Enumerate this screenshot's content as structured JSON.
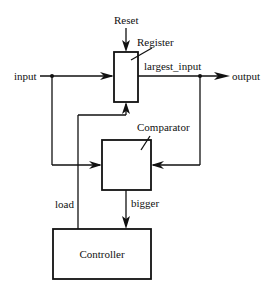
{
  "diagram": {
    "type": "block-diagram",
    "blocks": {
      "register": {
        "label": "Register"
      },
      "comparator": {
        "label": "Comparator"
      },
      "controller": {
        "label": "Controller"
      }
    },
    "signals": {
      "reset": "Reset",
      "input": "input",
      "output": "output",
      "largest_input": "largest_input",
      "load": "load",
      "bigger": "bigger"
    },
    "colors": {
      "stroke": "#111111",
      "background": "#ffffff"
    }
  }
}
